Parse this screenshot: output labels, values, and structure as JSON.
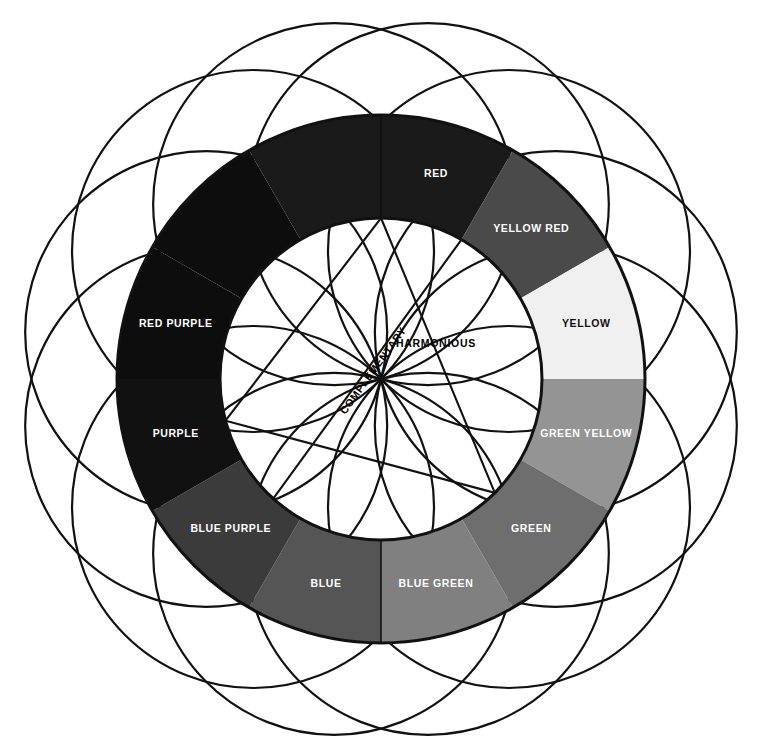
{
  "diagram": {
    "center": {
      "x": 381,
      "y": 379
    },
    "outer_radius": 264,
    "inner_radius": 161,
    "petal_radius": 181,
    "petal_count": 12,
    "background": "#ffffff",
    "stroke_color": "#111111"
  },
  "segments": [
    {
      "label": "RED",
      "color": "#1a1a1a",
      "text_color": "#ffffff",
      "start_angle": 0,
      "end_angle": 30
    },
    {
      "label": "YELLOW RED",
      "color": "#4a4a4a",
      "text_color": "#ffffff",
      "start_angle": 30,
      "end_angle": 60
    },
    {
      "label": "YELLOW",
      "color": "#f0f0f0",
      "text_color": "#111111",
      "start_angle": 60,
      "end_angle": 90
    },
    {
      "label": "GREEN YELLOW",
      "color": "#949494",
      "text_color": "#ffffff",
      "start_angle": 90,
      "end_angle": 120
    },
    {
      "label": "GREEN",
      "color": "#6e6e6e",
      "text_color": "#ffffff",
      "start_angle": 120,
      "end_angle": 150
    },
    {
      "label": "BLUE GREEN",
      "color": "#808080",
      "text_color": "#ffffff",
      "start_angle": 150,
      "end_angle": 180
    },
    {
      "label": "BLUE",
      "color": "#555555",
      "text_color": "#ffffff",
      "start_angle": 180,
      "end_angle": 210
    },
    {
      "label": "BLUE PURPLE",
      "color": "#3b3b3b",
      "text_color": "#ffffff",
      "start_angle": 210,
      "end_angle": 240
    },
    {
      "label": "PURPLE",
      "color": "#111111",
      "text_color": "#ffffff",
      "start_angle": 240,
      "end_angle": 270
    },
    {
      "label": "RED PURPLE",
      "color": "#0d0d0d",
      "text_color": "#ffffff",
      "start_angle": 270,
      "end_angle": 300
    },
    {
      "label": "RED PURPLE 2",
      "color": "#0d0d0d",
      "text_color": "#ffffff",
      "start_angle": 300,
      "end_angle": 330,
      "hide_label": true
    },
    {
      "label": "RED 2",
      "color": "#1a1a1a",
      "text_color": "#ffffff",
      "start_angle": 330,
      "end_angle": 360,
      "hide_label": true
    }
  ],
  "annotations": {
    "complementary": "COMPLEMENTARY",
    "harmonious": "HARMONIOUS"
  },
  "triangle": {
    "vertices_deg": [
      0,
      135,
      255
    ],
    "name": "harmonious-triangle"
  },
  "complementary_line": {
    "from_deg": 222,
    "to_deg": 30,
    "name": "complementary-line"
  }
}
